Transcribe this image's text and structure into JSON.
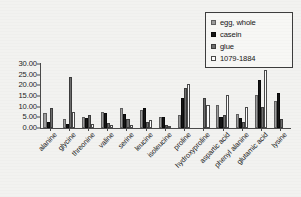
{
  "chart_data": {
    "type": "bar",
    "title": "",
    "subtitle": "",
    "xlabel": "",
    "ylabel": "",
    "ylim": [
      0,
      30
    ],
    "ytick_step": 5,
    "ytick_labels": [
      "30.00",
      "25.00",
      "20.00",
      "15.00",
      "10.00",
      "5.00",
      "0.00"
    ],
    "ytick_values": [
      30,
      25,
      20,
      15,
      10,
      5,
      0
    ],
    "grid": false,
    "legend_position": "top-right",
    "categories": [
      "alanine",
      "glycine",
      "threonine",
      "valine",
      "serine",
      "leucine",
      "isoleucine",
      "proline",
      "hydroxyproline",
      "aspartic acid",
      "phenyl alanine",
      "glutamic acid",
      "lysine"
    ],
    "series": [
      {
        "name": "egg, whole",
        "color": "#9c9c9c",
        "values": [
          7.0,
          4.3,
          5.0,
          7.7,
          9.5,
          8.5,
          5.3,
          6.0,
          0.0,
          10.8,
          6.8,
          15.5,
          12.8
        ]
      },
      {
        "name": "casein",
        "color": "#161616",
        "values": [
          3.0,
          1.7,
          4.5,
          7.0,
          6.8,
          9.3,
          5.0,
          14.0,
          0.0,
          5.3,
          4.5,
          22.3,
          16.3
        ]
      },
      {
        "name": "glue",
        "color": "#6e6e6e",
        "values": [
          9.5,
          24.0,
          6.0,
          2.5,
          4.0,
          3.0,
          1.5,
          18.7,
          14.3,
          6.3,
          2.9,
          10.0,
          4.3
        ]
      },
      {
        "name": "1079-1884",
        "color": "#fdfdfd",
        "values": [
          0.0,
          7.5,
          2.0,
          1.5,
          1.3,
          3.6,
          0.8,
          20.5,
          11.0,
          15.3,
          9.7,
          27.0,
          0.0
        ]
      }
    ]
  },
  "legend": {
    "items": [
      {
        "label": "egg, whole"
      },
      {
        "label": "casein"
      },
      {
        "label": "glue"
      },
      {
        "label": "1079-1884"
      }
    ]
  }
}
